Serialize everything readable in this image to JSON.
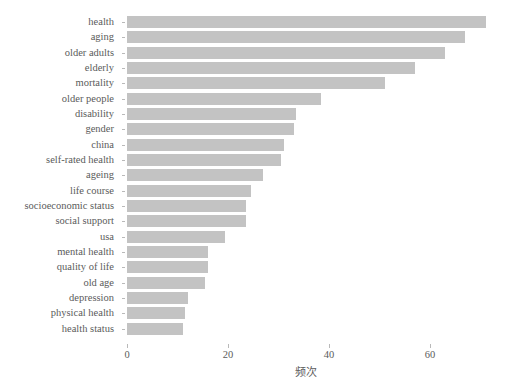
{
  "chart_data": {
    "type": "bar",
    "orientation": "horizontal",
    "title": "",
    "subtitle": "",
    "xlabel": "频次",
    "ylabel": "",
    "xlim": [
      0,
      71
    ],
    "xticks": [
      0,
      20,
      40,
      60
    ],
    "xtick_labels": [
      "0",
      "20",
      "40",
      "60"
    ],
    "grid": false,
    "legend": null,
    "bar_color": "#c3c3c3",
    "text_color": "#5b5b5b",
    "background": "#ffffff",
    "categories": [
      "health",
      "aging",
      "older adults",
      "elderly",
      "mortality",
      "older people",
      "disability",
      "gender",
      "china",
      "self-rated health",
      "ageing",
      "life course",
      "socioeconomic status",
      "social support",
      "usa",
      "mental health",
      "quality of life",
      "old age",
      "depression",
      "physical health",
      "health status"
    ],
    "values": [
      71,
      67,
      63,
      57,
      51,
      38.5,
      33.5,
      33,
      31,
      30.5,
      27,
      24.5,
      23.5,
      23.5,
      19.5,
      16,
      16,
      15.5,
      12,
      11.5,
      11
    ]
  }
}
